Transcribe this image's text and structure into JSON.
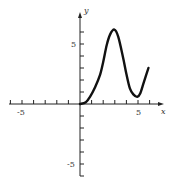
{
  "chart_data": {
    "type": "line",
    "title": "",
    "xlabel": "x",
    "ylabel": "y",
    "xlim": [
      -6.1,
      7.2
    ],
    "ylim": [
      -6.1,
      7.5
    ],
    "grid": false,
    "legend": null,
    "x_ticks": [
      -6,
      -5,
      -4,
      -3,
      -2,
      -1,
      1,
      2,
      3,
      4,
      5,
      6
    ],
    "y_ticks": [
      -6,
      -5,
      -4,
      -3,
      -2,
      -1,
      1,
      2,
      3,
      4,
      5,
      6
    ],
    "x_tick_labels": [
      {
        "value": -5,
        "text": "-5"
      },
      {
        "value": 5,
        "text": "5"
      }
    ],
    "y_tick_labels": [
      {
        "value": 5,
        "text": "5"
      },
      {
        "value": -5,
        "text": "-5"
      }
    ],
    "series": [
      {
        "name": "f(x)",
        "x": [
          0,
          0.5,
          0.86,
          1.3,
          1.72,
          2.0,
          2.3,
          2.6,
          2.96,
          3.3,
          3.73,
          4.0,
          4.3,
          4.6,
          4.94,
          5.2,
          5.5,
          5.9
        ],
        "y": [
          0,
          0.15,
          0.6,
          1.4,
          2.4,
          3.5,
          4.9,
          5.8,
          6.2,
          5.6,
          3.8,
          2.5,
          1.3,
          0.8,
          0.6,
          0.9,
          1.8,
          3.0
        ]
      }
    ]
  },
  "labels": {
    "x_axis": "x",
    "y_axis": "y",
    "x_neg5": "-5",
    "x_pos5": "5",
    "y_pos5": "5",
    "y_neg5": "-5"
  }
}
